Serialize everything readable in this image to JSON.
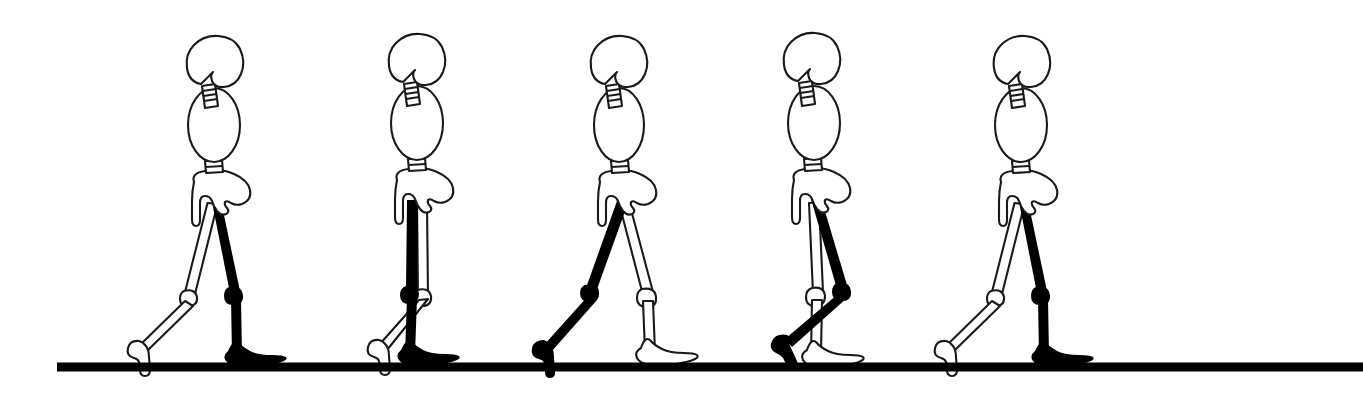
{
  "figure_title": "Human gait cycle — sagittal skeletal stick diagram",
  "canvas": {
    "width": 1363,
    "height": 402,
    "background_color": "#ffffff",
    "ink_color": "#000000",
    "outline_color": "#1a1a1a"
  },
  "ground": {
    "label": "ground line",
    "x_start": 57,
    "x_end": 1363,
    "y": 367,
    "thickness": 9,
    "color": "#000000"
  },
  "legend": {
    "near_limb": "near leg (solid black)",
    "far_limb": "far leg (white outline)",
    "near_color": "#000000",
    "far_color": "#ffffff"
  },
  "body_parts": [
    {
      "name": "skull",
      "style": "outline"
    },
    {
      "name": "cervical-spine",
      "style": "ladder-outline"
    },
    {
      "name": "thorax",
      "style": "ellipse-outline"
    },
    {
      "name": "lumbar-segment",
      "style": "block-outline"
    },
    {
      "name": "pelvis",
      "style": "outline"
    },
    {
      "name": "near-femur",
      "style": "solid-black"
    },
    {
      "name": "near-tibia",
      "style": "solid-black"
    },
    {
      "name": "near-foot",
      "style": "solid-black"
    },
    {
      "name": "far-femur",
      "style": "outline"
    },
    {
      "name": "far-tibia",
      "style": "outline"
    },
    {
      "name": "far-foot",
      "style": "outline"
    }
  ],
  "figures": [
    {
      "index": 1,
      "label": "Frame 1",
      "phase": "terminal stance / pre-swing",
      "center_x": 215,
      "near_leg_state": "vertical, foot flat on ground (forward limb)",
      "far_leg_state": "trailing, heel raised, toe contact"
    },
    {
      "index": 2,
      "label": "Frame 2",
      "phase": "mid-stance",
      "center_x": 417,
      "near_leg_state": "vertical under body, foot flat",
      "far_leg_state": "trailing behind, heel off, toes down"
    },
    {
      "index": 3,
      "label": "Frame 3",
      "phase": "toe-off / initial swing",
      "center_x": 622,
      "near_leg_state": "extended backward, toe-off far behind",
      "far_leg_state": "forward, vertical, foot flat on ground"
    },
    {
      "index": 4,
      "label": "Frame 4",
      "phase": "mid-swing",
      "center_x": 820,
      "near_leg_state": "knee flexed, shank swinging forward, foot clear of ground",
      "far_leg_state": "vertical support limb, foot flat"
    },
    {
      "index": 5,
      "label": "Frame 5",
      "phase": "terminal stance / pre-swing (cycle repeats)",
      "center_x": 1022,
      "near_leg_state": "vertical, foot flat on ground (forward limb)",
      "far_leg_state": "trailing, heel raised, toe contact"
    }
  ]
}
